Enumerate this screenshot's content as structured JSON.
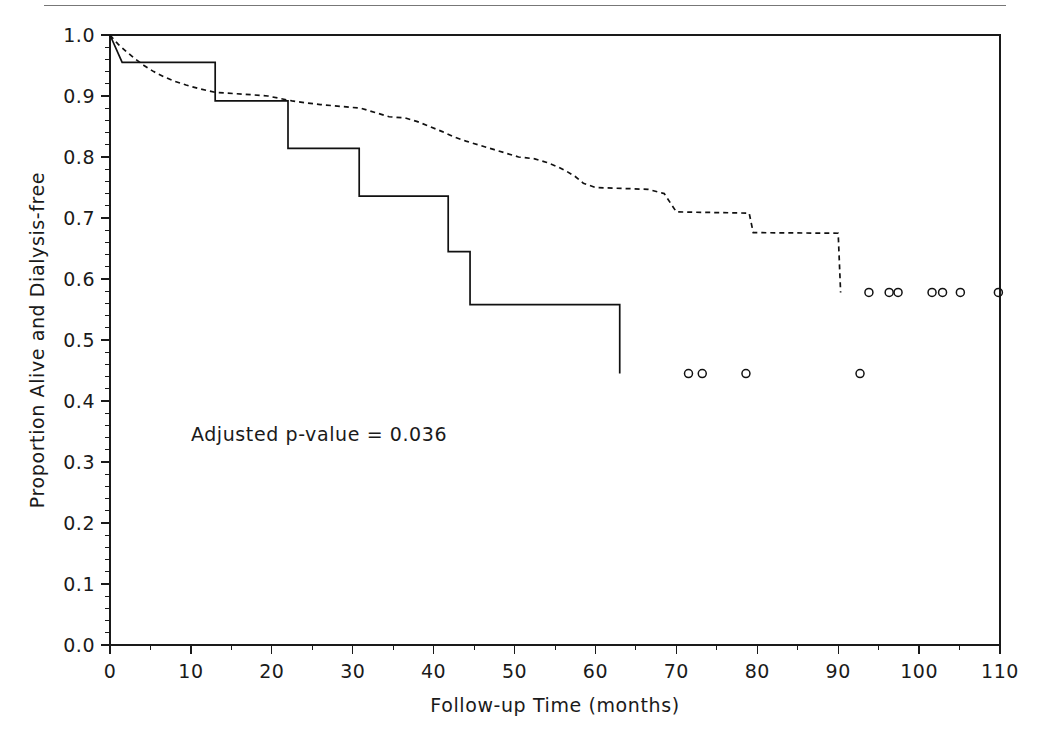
{
  "figure": {
    "kind": "kaplan-meier-survival-plot",
    "page_rule_visible": true,
    "background_color": "#ffffff",
    "ink_color": "#111111"
  },
  "annotations": [
    {
      "name": "p-value-annotation",
      "text": "Adjusted p-value = 0.036",
      "x": 10,
      "y": 0.335
    }
  ],
  "chart_data": {
    "type": "line",
    "subtype": "kaplan-meier-step",
    "title": "",
    "xlabel": "Follow-up Time (months)",
    "ylabel": "Proportion Alive and Dialysis-free",
    "xlim": [
      0,
      110
    ],
    "ylim": [
      0.0,
      1.0
    ],
    "grid": false,
    "legend": "none",
    "x_ticks": [
      0,
      10,
      20,
      30,
      40,
      50,
      60,
      70,
      80,
      90,
      100,
      110
    ],
    "x_ticklabels": [
      "0",
      "10",
      "20",
      "30",
      "40",
      "50",
      "60",
      "70",
      "80",
      "90",
      "100",
      "110"
    ],
    "x_minor_tick_step": 5,
    "y_ticks": [
      0.0,
      0.1,
      0.2,
      0.3,
      0.4,
      0.5,
      0.6,
      0.7,
      0.8,
      0.9,
      1.0
    ],
    "y_ticklabels": [
      "0.0",
      "0.1",
      "0.2",
      "0.3",
      "0.4",
      "0.5",
      "0.6",
      "0.7",
      "0.8",
      "0.9",
      "1.0"
    ],
    "y_minor_tick_step": 0.02,
    "series": [
      {
        "name": "group-solid",
        "style": "solid",
        "steps": [
          [
            0.0,
            1.0
          ],
          [
            1.5,
            0.955
          ],
          [
            13.0,
            0.955
          ],
          [
            13.0,
            0.892
          ],
          [
            22.0,
            0.892
          ],
          [
            22.0,
            0.814
          ],
          [
            30.8,
            0.814
          ],
          [
            30.8,
            0.736
          ],
          [
            41.8,
            0.736
          ],
          [
            41.8,
            0.645
          ],
          [
            44.5,
            0.645
          ],
          [
            44.5,
            0.558
          ],
          [
            63.0,
            0.558
          ],
          [
            63.0,
            0.445
          ]
        ],
        "censor_value": 0.445,
        "censor_times": [
          71.5,
          73.2,
          78.6,
          92.7
        ]
      },
      {
        "name": "group-dashed",
        "style": "dashed",
        "steps": [
          [
            0.0,
            1.0
          ],
          [
            1.0,
            0.985
          ],
          [
            2.0,
            0.973
          ],
          [
            3.0,
            0.962
          ],
          [
            4.2,
            0.95
          ],
          [
            5.4,
            0.94
          ],
          [
            6.6,
            0.932
          ],
          [
            8.0,
            0.924
          ],
          [
            9.4,
            0.918
          ],
          [
            11.0,
            0.912
          ],
          [
            13.0,
            0.906
          ],
          [
            16.5,
            0.903
          ],
          [
            19.5,
            0.9
          ],
          [
            21.0,
            0.896
          ],
          [
            22.5,
            0.892
          ],
          [
            24.0,
            0.889
          ],
          [
            26.0,
            0.886
          ],
          [
            28.5,
            0.883
          ],
          [
            31.0,
            0.88
          ],
          [
            33.0,
            0.872
          ],
          [
            34.5,
            0.866
          ],
          [
            36.5,
            0.864
          ],
          [
            38.0,
            0.858
          ],
          [
            39.5,
            0.85
          ],
          [
            41.0,
            0.842
          ],
          [
            42.5,
            0.833
          ],
          [
            44.0,
            0.826
          ],
          [
            46.0,
            0.818
          ],
          [
            47.5,
            0.812
          ],
          [
            49.0,
            0.806
          ],
          [
            50.5,
            0.8
          ],
          [
            52.5,
            0.797
          ],
          [
            54.0,
            0.791
          ],
          [
            55.5,
            0.783
          ],
          [
            56.5,
            0.776
          ],
          [
            57.5,
            0.768
          ],
          [
            58.5,
            0.757
          ],
          [
            60.0,
            0.75
          ],
          [
            66.5,
            0.747
          ],
          [
            68.5,
            0.74
          ],
          [
            70.0,
            0.71
          ],
          [
            79.0,
            0.708
          ],
          [
            79.5,
            0.676
          ],
          [
            90.0,
            0.675
          ],
          [
            90.3,
            0.578
          ]
        ],
        "censor_value": 0.578,
        "censor_times": [
          93.8,
          96.3,
          97.4,
          101.6,
          102.9,
          105.1,
          109.8
        ]
      }
    ]
  }
}
